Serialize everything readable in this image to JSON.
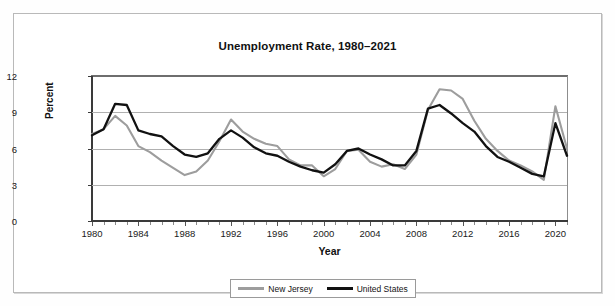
{
  "chart_data": {
    "type": "line",
    "title": "Unemployment Rate, 1980–2021",
    "xlabel": "Year",
    "ylabel": "Percent",
    "xlim": [
      1980,
      2021
    ],
    "ylim": [
      0,
      12
    ],
    "yticks": [
      0,
      3,
      6,
      9,
      12
    ],
    "xticks": [
      1980,
      1984,
      1988,
      1992,
      1996,
      2000,
      2004,
      2008,
      2012,
      2016,
      2020
    ],
    "grid": "horizontal",
    "legend_position": "bottom",
    "x": [
      1980,
      1981,
      1982,
      1983,
      1984,
      1985,
      1986,
      1987,
      1988,
      1989,
      1990,
      1991,
      1992,
      1993,
      1994,
      1995,
      1996,
      1997,
      1998,
      1999,
      2000,
      2001,
      2002,
      2003,
      2004,
      2005,
      2006,
      2007,
      2008,
      2009,
      2010,
      2011,
      2012,
      2013,
      2014,
      2015,
      2016,
      2017,
      2018,
      2019,
      2020,
      2021
    ],
    "series": [
      {
        "name": "New Jersey",
        "color": "#9d9d9d",
        "values": [
          7.2,
          7.6,
          8.7,
          7.9,
          6.2,
          5.7,
          5.0,
          4.4,
          3.8,
          4.1,
          5.0,
          6.6,
          8.4,
          7.4,
          6.8,
          6.4,
          6.2,
          5.1,
          4.6,
          4.6,
          3.7,
          4.3,
          5.8,
          5.9,
          4.9,
          4.5,
          4.7,
          4.3,
          5.5,
          9.2,
          10.9,
          10.8,
          10.1,
          8.3,
          6.8,
          5.8,
          5.0,
          4.6,
          4.1,
          3.4,
          9.5,
          6.0
        ]
      },
      {
        "name": "United States",
        "color": "#111111",
        "values": [
          7.1,
          7.6,
          9.7,
          9.6,
          7.5,
          7.2,
          7.0,
          6.2,
          5.5,
          5.3,
          5.6,
          6.8,
          7.5,
          6.9,
          6.1,
          5.6,
          5.4,
          4.9,
          4.5,
          4.2,
          4.0,
          4.7,
          5.8,
          6.0,
          5.5,
          5.1,
          4.6,
          4.6,
          5.8,
          9.3,
          9.6,
          8.9,
          8.1,
          7.4,
          6.2,
          5.3,
          4.9,
          4.4,
          3.9,
          3.7,
          8.1,
          5.4
        ]
      }
    ]
  },
  "legend": {
    "items": [
      {
        "label": "New Jersey"
      },
      {
        "label": "United States"
      }
    ]
  }
}
